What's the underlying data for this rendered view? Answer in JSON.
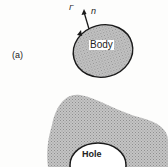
{
  "figure": {
    "panel_a": {
      "label": "(a)",
      "boundary_label": "Γ",
      "normal_label": "n",
      "body_label": "Body"
    },
    "panel_b": {
      "hole_label": "Hole"
    }
  },
  "colors": {
    "background": "#fdfdfc",
    "shading": "#b8b8b8",
    "outline": "#1a1a1a",
    "hole_fill": "#ffffff"
  }
}
